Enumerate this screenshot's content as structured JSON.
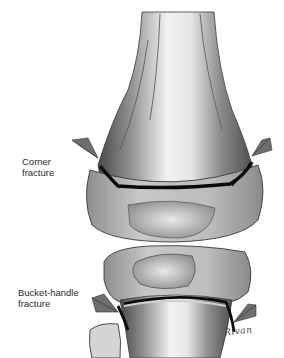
{
  "figure": {
    "type": "medical-illustration",
    "labels": {
      "corner_fracture": [
        "Corner",
        "fracture"
      ],
      "bucket_handle_fracture": [
        "Bucket-handle",
        "fracture"
      ]
    },
    "signature": "Rivan",
    "colors": {
      "background": "#ffffff",
      "bone_light": "#d9d9d9",
      "bone_mid": "#a8a8a8",
      "bone_dark": "#5a5a5a",
      "fracture_line": "#0a0a0a",
      "arrow_fill": "#6e6e6e",
      "text": "#2a2a2a"
    },
    "arrows": [
      {
        "name": "corner-fracture-arrow-left",
        "pointing": "right-down"
      },
      {
        "name": "corner-fracture-arrow-right",
        "pointing": "left-down"
      },
      {
        "name": "bucket-handle-arrow-left",
        "pointing": "right-down"
      },
      {
        "name": "bucket-handle-arrow-right",
        "pointing": "left-down"
      }
    ]
  }
}
